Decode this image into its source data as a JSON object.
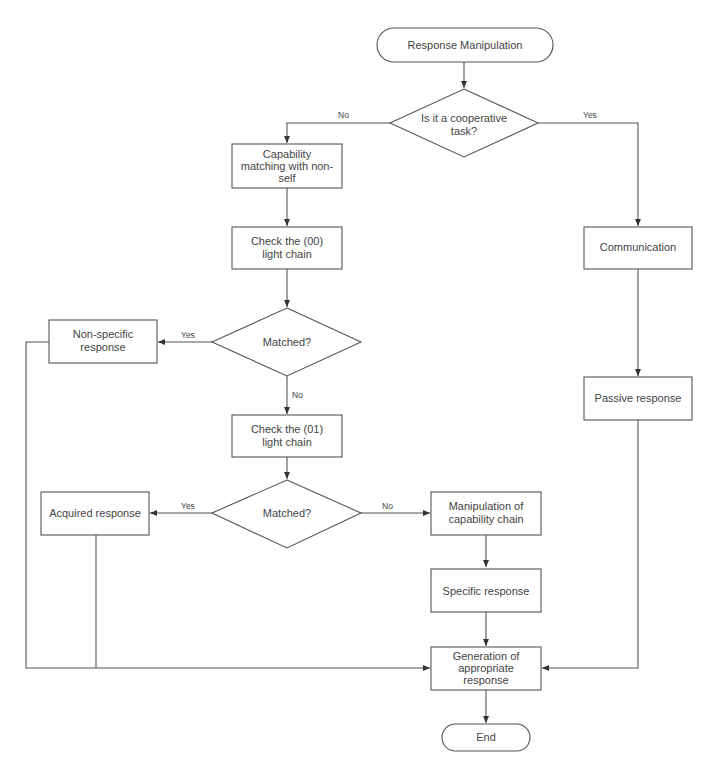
{
  "diagram": {
    "type": "flowchart",
    "nodes": {
      "start": {
        "shape": "terminal",
        "lines": [
          "Response Manipulation"
        ]
      },
      "cooperative": {
        "shape": "decision",
        "lines": [
          "Is it a cooperative",
          "task?"
        ]
      },
      "capability_matching": {
        "shape": "process",
        "lines": [
          "Capability",
          "matching with non-",
          "self"
        ]
      },
      "check_00": {
        "shape": "process",
        "lines": [
          "Check the (00)",
          "light chain"
        ]
      },
      "matched_1": {
        "shape": "decision",
        "lines": [
          "Matched?"
        ]
      },
      "non_specific": {
        "shape": "process",
        "lines": [
          "Non-specific",
          "response"
        ]
      },
      "check_01": {
        "shape": "process",
        "lines": [
          "Check the (01)",
          "light chain"
        ]
      },
      "matched_2": {
        "shape": "decision",
        "lines": [
          "Matched?"
        ]
      },
      "acquired": {
        "shape": "process",
        "lines": [
          "Acquired response"
        ]
      },
      "manipulation": {
        "shape": "process",
        "lines": [
          "Manipulation of",
          "capability chain"
        ]
      },
      "specific": {
        "shape": "process",
        "lines": [
          "Specific response"
        ]
      },
      "communication": {
        "shape": "process",
        "lines": [
          "Communication"
        ]
      },
      "passive": {
        "shape": "process",
        "lines": [
          "Passive response"
        ]
      },
      "generation": {
        "shape": "process",
        "lines": [
          "Generation of",
          "appropriate",
          "response"
        ]
      },
      "end": {
        "shape": "terminal",
        "lines": [
          "End"
        ]
      }
    },
    "edges": [
      {
        "from": "start",
        "to": "cooperative",
        "label": ""
      },
      {
        "from": "cooperative",
        "to": "capability_matching",
        "label": "No"
      },
      {
        "from": "cooperative",
        "to": "communication",
        "label": "Yes"
      },
      {
        "from": "capability_matching",
        "to": "check_00",
        "label": ""
      },
      {
        "from": "check_00",
        "to": "matched_1",
        "label": ""
      },
      {
        "from": "matched_1",
        "to": "non_specific",
        "label": "Yes"
      },
      {
        "from": "matched_1",
        "to": "check_01",
        "label": "No"
      },
      {
        "from": "check_01",
        "to": "matched_2",
        "label": ""
      },
      {
        "from": "matched_2",
        "to": "acquired",
        "label": "Yes"
      },
      {
        "from": "matched_2",
        "to": "manipulation",
        "label": "No"
      },
      {
        "from": "manipulation",
        "to": "specific",
        "label": ""
      },
      {
        "from": "specific",
        "to": "generation",
        "label": ""
      },
      {
        "from": "non_specific",
        "to": "generation",
        "label": ""
      },
      {
        "from": "acquired",
        "to": "generation",
        "label": ""
      },
      {
        "from": "communication",
        "to": "passive",
        "label": ""
      },
      {
        "from": "passive",
        "to": "generation",
        "label": ""
      },
      {
        "from": "generation",
        "to": "end",
        "label": ""
      }
    ],
    "edge_labels": {
      "cooperative_no": "No",
      "cooperative_yes": "Yes",
      "matched1_yes": "Yes",
      "matched1_no": "No",
      "matched2_yes": "Yes",
      "matched2_no": "No"
    },
    "colors": {
      "stroke": "#555555",
      "text": "#444444",
      "background": "#ffffff"
    }
  }
}
